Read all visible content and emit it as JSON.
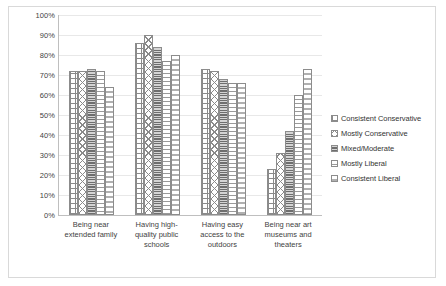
{
  "chart_data": {
    "type": "bar",
    "title": "",
    "xlabel": "",
    "ylabel": "",
    "ylim": [
      0,
      100
    ],
    "yticks": [
      "0%",
      "10%",
      "20%",
      "30%",
      "40%",
      "50%",
      "60%",
      "70%",
      "80%",
      "90%",
      "100%"
    ],
    "ytick_values": [
      0,
      10,
      20,
      30,
      40,
      50,
      60,
      70,
      80,
      90,
      100
    ],
    "grid": true,
    "legend_position": "right",
    "categories": [
      "Being near extended family",
      "Having high-quality public schools",
      "Having easy access to the outdoors",
      "Being near art museums and theaters"
    ],
    "series": [
      {
        "name": "Consistent Conservative",
        "pattern": "grid-hatch",
        "values": [
          72,
          86,
          73,
          23
        ]
      },
      {
        "name": "Mostly Conservative",
        "pattern": "diagonal-crosshatch",
        "values": [
          72,
          90,
          72,
          31
        ]
      },
      {
        "name": "Mixed/Moderate",
        "pattern": "dense-horizontal",
        "values": [
          73,
          84,
          68,
          42
        ]
      },
      {
        "name": "Mostly Liberal",
        "pattern": "sparse-dash",
        "values": [
          72,
          77,
          66,
          60
        ]
      },
      {
        "name": "Consistent Liberal",
        "pattern": "vertical-dashed",
        "values": [
          64,
          80,
          66,
          73
        ]
      }
    ]
  },
  "legend": {
    "items": [
      {
        "label": "Consistent Conservative"
      },
      {
        "label": "Mostly Conservative"
      },
      {
        "label": "Mixed/Moderate"
      },
      {
        "label": "Mostly Liberal"
      },
      {
        "label": "Consistent Liberal"
      }
    ]
  }
}
